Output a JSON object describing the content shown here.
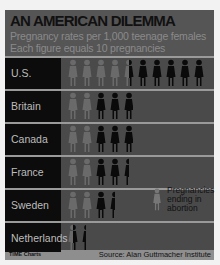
{
  "header": {
    "title": "AN AMERICAN DILEMMA",
    "subtitle1": "Pregnancy rates per 1,000 teenage females",
    "subtitle2": "Each figure equals 10 pregnancies"
  },
  "legend": {
    "label": "Pregnancies ending in abortion",
    "icon": "faded-female-figure-icon"
  },
  "footer": {
    "credit": "TIME Charts",
    "source": "Source: Alan Guttmacher Institute"
  },
  "colors": {
    "background": "#4a4a4a",
    "label_bg": "#0c0c0c",
    "figure_total": "#0a0a0a",
    "figure_abortion": "#6a6a6a",
    "divider": "#9a9a9a"
  },
  "chart_data": {
    "type": "bar",
    "orientation": "horizontal",
    "style": "pictograph",
    "title": "AN AMERICAN DILEMMA",
    "subtitle": "Pregnancy rates per 1,000 teenage females",
    "unit_note": "Each figure equals 10 pregnancies",
    "categories": [
      "U.S.",
      "Britain",
      "Canada",
      "France",
      "Sweden",
      "Netherlands"
    ],
    "series": [
      {
        "name": "Pregnancies ending in abortion",
        "values": [
          45,
          20,
          20,
          20,
          20,
          5
        ]
      },
      {
        "name": "Other pregnancies",
        "values": [
          55,
          28,
          28,
          25,
          15,
          9
        ]
      }
    ],
    "totals": [
      100,
      48,
      48,
      45,
      35,
      14
    ],
    "stacked": true,
    "legend_position": "right-inside",
    "grid": false,
    "source": "Source: Alan Guttmacher Institute",
    "credit": "TIME Charts"
  }
}
